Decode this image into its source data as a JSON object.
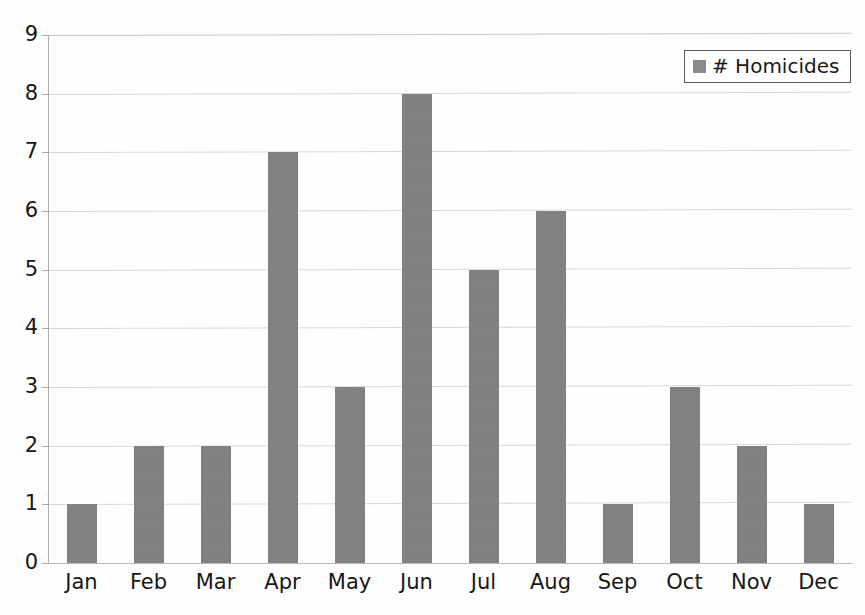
{
  "chart_data": {
    "type": "bar",
    "title": "",
    "subtitle": "",
    "xlabel": "",
    "ylabel": "",
    "categories": [
      "Jan",
      "Feb",
      "Mar",
      "Apr",
      "May",
      "Jun",
      "Jul",
      "Aug",
      "Sep",
      "Oct",
      "Nov",
      "Dec"
    ],
    "series": [
      {
        "name": "# Homicides",
        "values": [
          1,
          2,
          2,
          7,
          3,
          8,
          5,
          6,
          1,
          3,
          2,
          1
        ],
        "color": "#818181"
      }
    ],
    "ylim": [
      0,
      9
    ],
    "ytick_labels": [
      "0",
      "1",
      "2",
      "3",
      "4",
      "5",
      "6",
      "7",
      "8",
      "9"
    ],
    "ytick_values": [
      0,
      1,
      2,
      3,
      4,
      5,
      6,
      7,
      8,
      9
    ],
    "grid": true,
    "grid_axis": "y",
    "grid_color": "#d8d8d8",
    "legend_position": "top-right",
    "annotations": []
  },
  "legend": {
    "entries": [
      {
        "label": "# Homicides",
        "swatch_color": "#8a8a8a"
      }
    ]
  },
  "colors": {
    "background": "#fefefe",
    "bar": "#818181",
    "grid": "#d8d8d8",
    "axis": "#b0b0b0",
    "text": "#171717",
    "legend_border": "#5a5a5a"
  }
}
